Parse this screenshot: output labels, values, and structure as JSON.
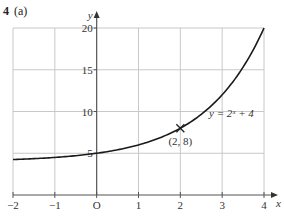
{
  "question": {
    "number": "4",
    "part": "(a)"
  },
  "chart_data": {
    "type": "line",
    "title": "",
    "xlabel": "x",
    "ylabel": "y",
    "xlim": [
      -2,
      4
    ],
    "ylim": [
      0,
      20
    ],
    "grid": true,
    "x_ticks": [
      -2,
      -1,
      0,
      1,
      2,
      3,
      4
    ],
    "x_tick_labels": [
      "−2",
      "−1",
      "O",
      "1",
      "2",
      "3",
      "4"
    ],
    "y_ticks": [
      5,
      10,
      15,
      20
    ],
    "y_tick_labels": [
      "5",
      "10",
      "15",
      "20"
    ],
    "series": [
      {
        "name": "y = 2^x + 4",
        "function": "2^x + 4",
        "x": [
          -2,
          -1.5,
          -1,
          -0.5,
          0,
          0.5,
          1,
          1.5,
          2,
          2.5,
          3,
          3.5,
          4
        ],
        "values": [
          4.25,
          4.35,
          4.5,
          4.71,
          5,
          5.41,
          6,
          6.83,
          8,
          9.66,
          12,
          15.31,
          20
        ]
      }
    ],
    "annotations": [
      {
        "text": "y = 2ˣ + 4",
        "x": 2.6,
        "y": 10.5,
        "kind": "curve-label"
      },
      {
        "text": "(2, 8)",
        "x": 2,
        "y": 8,
        "kind": "marked-point",
        "marker": "x"
      }
    ],
    "colors": {
      "curve": "#1a1a1a",
      "grid": "#c8c8c8",
      "axis": "#555555"
    }
  }
}
